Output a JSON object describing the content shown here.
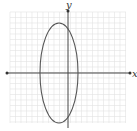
{
  "diagram": {
    "x_axis_label": "x",
    "y_axis_label": "y",
    "grid_color": "#e2e2e2",
    "axis_color": "#444444",
    "curve_color": "#555555",
    "ellipse": {
      "center_px": [
        58,
        73
      ],
      "rx_px": 19,
      "ry_px": 50
    }
  }
}
